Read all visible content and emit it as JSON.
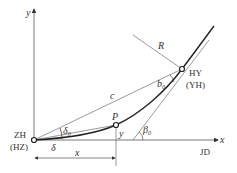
{
  "diagram": {
    "axes": {
      "x_label": "x",
      "y_label": "y"
    },
    "points": {
      "start": {
        "label": "ZH",
        "alt_label": "(HZ)"
      },
      "end": {
        "label": "HY",
        "alt_label": "(YH)"
      },
      "p": {
        "label": "P"
      },
      "jd": {
        "label": "JD"
      }
    },
    "labels": {
      "radius": "R",
      "chord": "c",
      "delta": "δ",
      "delta0": "δ",
      "delta0_sub": "0",
      "b0": "b",
      "b0_sub": "0",
      "beta0": "β",
      "beta0_sub": "0",
      "x_dim": "x",
      "y_dim": "y"
    },
    "colors": {
      "line": "#333333",
      "thin_line": "#555555"
    }
  }
}
